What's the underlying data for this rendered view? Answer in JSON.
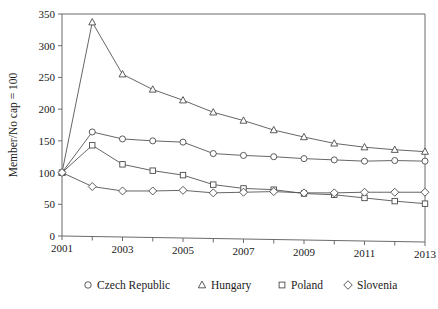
{
  "chart_data": {
    "type": "line",
    "title": "",
    "xlabel": "",
    "ylabel": "Member/No cap = 100",
    "x": [
      2001,
      2002,
      2003,
      2004,
      2005,
      2006,
      2007,
      2008,
      2009,
      2010,
      2011,
      2012,
      2013
    ],
    "xlim": [
      2001,
      2013
    ],
    "ylim": [
      0,
      350
    ],
    "xticks": [
      2001,
      2002,
      2003,
      2004,
      2005,
      2006,
      2007,
      2008,
      2009,
      2010,
      2011,
      2012,
      2013
    ],
    "xtick_labels": [
      "2001",
      "",
      "2003",
      "",
      "2005",
      "",
      "2007",
      "",
      "2009",
      "",
      "2011",
      "",
      "2013"
    ],
    "yticks": [
      0,
      50,
      100,
      150,
      200,
      250,
      300,
      350
    ],
    "ytick_labels": [
      "0",
      "50",
      "100",
      "150",
      "200",
      "250",
      "300",
      "350"
    ],
    "grid": false,
    "legend_position": "below",
    "series": [
      {
        "name": "Czech Republic",
        "marker": "circle",
        "color": "#4a4a4a",
        "values": [
          100,
          164,
          153,
          150,
          148,
          130,
          127,
          125,
          122,
          120,
          118,
          119,
          118
        ]
      },
      {
        "name": "Hungary",
        "marker": "triangle",
        "color": "#4a4a4a",
        "values": [
          100,
          337,
          255,
          231,
          214,
          195,
          182,
          167,
          156,
          146,
          140,
          136,
          133
        ]
      },
      {
        "name": "Poland",
        "marker": "square",
        "color": "#4a4a4a",
        "values": [
          100,
          143,
          113,
          103,
          96,
          81,
          75,
          73,
          67,
          65,
          60,
          55,
          51
        ]
      },
      {
        "name": "Slovenia",
        "marker": "diamond",
        "color": "#4a4a4a",
        "values": [
          100,
          78,
          71,
          71,
          72,
          68,
          69,
          70,
          68,
          68,
          69,
          69,
          69
        ]
      }
    ]
  },
  "legend": {
    "items": [
      {
        "label": "Czech Republic",
        "marker": "circle"
      },
      {
        "label": "Hungary",
        "marker": "triangle"
      },
      {
        "label": "Poland",
        "marker": "square"
      },
      {
        "label": "Slovenia",
        "marker": "diamond"
      }
    ]
  },
  "axes": {
    "y_axis_title": "Member/No cap = 100"
  }
}
